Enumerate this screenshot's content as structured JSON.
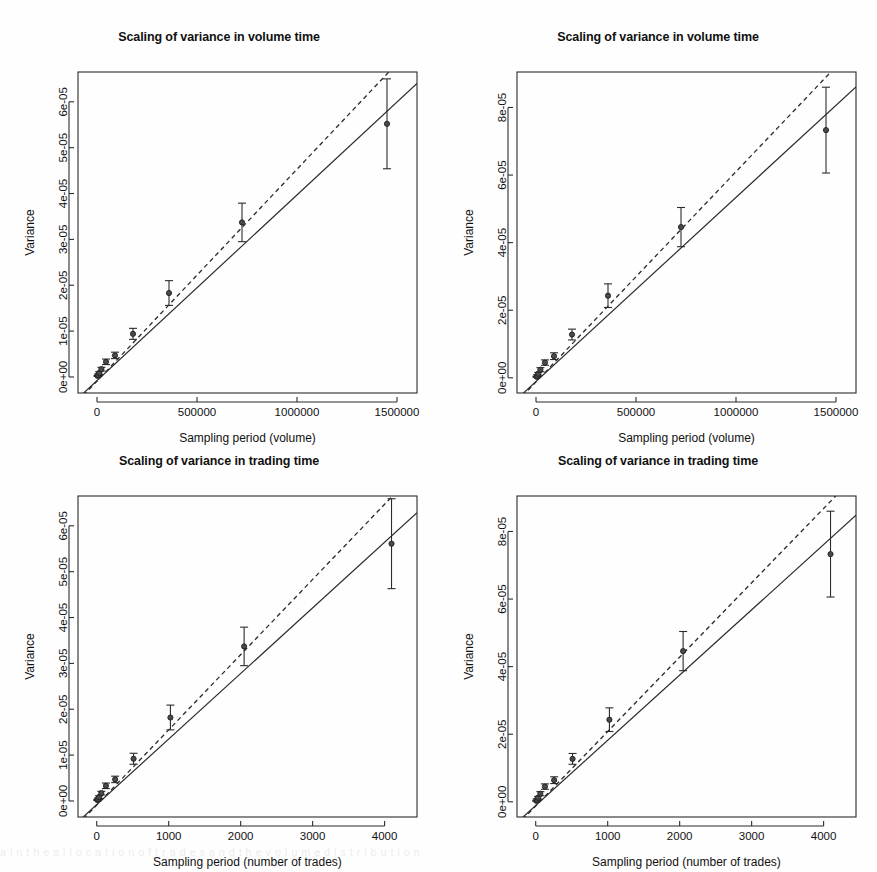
{
  "figure": {
    "width": 877,
    "height": 872,
    "background": "#ffffff",
    "ink_color": "#2b2b2b",
    "point_color": "#4a4a4a",
    "scan_artifact_text": "a i n t h e a l l o c a t i o n o f t r a d e s a n d t h e v o l u m e d i s t r i b u t i o n"
  },
  "chart_data": [
    {
      "id": "panel-tl",
      "type": "scatter",
      "title": "Scaling of variance in volume time",
      "xlabel": "Sampling period (volume)",
      "ylabel": "Variance",
      "xlim": [
        -95000,
        1600000
      ],
      "ylim": [
        -3.5e-06,
        6.65e-05
      ],
      "xticks": [
        0,
        500000,
        1000000,
        1500000
      ],
      "xticklabels": [
        "0",
        "500000",
        "1000000",
        "1500000"
      ],
      "yticks": [
        0,
        1e-05,
        2e-05,
        3e-05,
        4e-05,
        5e-05,
        6e-05
      ],
      "yticklabels": [
        "0e+00",
        "1e-05",
        "2e-05",
        "3e-05",
        "4e-05",
        "5e-05",
        "6e-05"
      ],
      "grid": false,
      "legend": "none",
      "x": [
        2800,
        5600,
        11000,
        22000,
        45000,
        90000,
        180000,
        360000,
        725000,
        1450000
      ],
      "y": [
        2.2e-07,
        4.4e-07,
        8.5e-07,
        1.7e-06,
        3.3e-06,
        4.7e-06,
        9.4e-06,
        1.83e-05,
        3.37e-05,
        5.52e-05
      ],
      "yerr_low": [
        1e-07,
        2e-07,
        3e-07,
        4e-07,
        6e-07,
        7e-07,
        1.2e-06,
        2.7e-06,
        4.2e-06,
        9.8e-06
      ],
      "yerr_high": [
        1e-07,
        2e-07,
        3e-07,
        4e-07,
        6e-07,
        7e-07,
        1.2e-06,
        2.7e-06,
        4.2e-06,
        9.8e-06
      ],
      "series": [
        {
          "name": "fitted line",
          "style": "solid",
          "intercept": -8e-07,
          "slope": 4.05e-11
        },
        {
          "name": "reference line",
          "style": "dashed",
          "intercept": -9e-07,
          "slope": 4.62e-11
        }
      ]
    },
    {
      "id": "panel-tr",
      "type": "scatter",
      "title": "Scaling of variance in volume time",
      "xlabel": "Sampling period (volume)",
      "ylabel": "Variance",
      "xlim": [
        -95000,
        1600000
      ],
      "ylim": [
        -4.5e-06,
        9.05e-05
      ],
      "xticks": [
        0,
        500000,
        1000000,
        1500000
      ],
      "xticklabels": [
        "0",
        "500000",
        "1000000",
        "1500000"
      ],
      "yticks": [
        0,
        2e-05,
        4e-05,
        6e-05,
        8e-05
      ],
      "yticklabels": [
        "0e+00",
        "2e-05",
        "4e-05",
        "6e-05",
        "8e-05"
      ],
      "grid": false,
      "legend": "none",
      "x": [
        2800,
        5600,
        11000,
        22000,
        45000,
        90000,
        180000,
        360000,
        725000,
        1450000
      ],
      "y": [
        3e-07,
        6e-07,
        1.2e-06,
        2.4e-06,
        4.5e-06,
        6.4e-06,
        1.28e-05,
        2.43e-05,
        4.46e-05,
        7.33e-05
      ],
      "yerr_low": [
        1.5e-07,
        3e-07,
        4e-07,
        6e-07,
        8e-07,
        1e-06,
        1.6e-06,
        3.5e-06,
        5.8e-06,
        1.27e-05
      ],
      "yerr_high": [
        1.5e-07,
        3e-07,
        4e-07,
        6e-07,
        8e-07,
        1e-06,
        1.6e-06,
        3.5e-06,
        5.8e-06,
        1.27e-05
      ],
      "series": [
        {
          "name": "fitted line",
          "style": "solid",
          "intercept": -1.1e-06,
          "slope": 5.45e-11
        },
        {
          "name": "reference line",
          "style": "dashed",
          "intercept": -1.2e-06,
          "slope": 6.22e-11
        }
      ]
    },
    {
      "id": "panel-bl",
      "type": "scatter",
      "title": "Scaling of variance in trading time",
      "xlabel": "Sampling period (number of trades)",
      "ylabel": "Variance",
      "xlim": [
        -260,
        4450
      ],
      "ylim": [
        -3.5e-06,
        6.65e-05
      ],
      "xticks": [
        0,
        1000,
        2000,
        3000,
        4000
      ],
      "xticklabels": [
        "0",
        "1000",
        "2000",
        "3000",
        "4000"
      ],
      "yticks": [
        0,
        1e-05,
        2e-05,
        3e-05,
        4e-05,
        5e-05,
        6e-05
      ],
      "yticklabels": [
        "0e+00",
        "1e-05",
        "2e-05",
        "3e-05",
        "4e-05",
        "5e-05",
        "6e-05"
      ],
      "grid": false,
      "legend": "none",
      "x": [
        8,
        16,
        32,
        64,
        128,
        256,
        512,
        1024,
        2048,
        4096
      ],
      "y": [
        2.1e-07,
        4.2e-07,
        8.3e-07,
        1.7e-06,
        3.3e-06,
        4.7e-06,
        9.2e-06,
        1.82e-05,
        3.37e-05,
        5.61e-05
      ],
      "yerr_low": [
        1e-07,
        2e-07,
        3e-07,
        4e-07,
        6e-07,
        7e-07,
        1.2e-06,
        2.7e-06,
        4.2e-06,
        9.8e-06
      ],
      "yerr_high": [
        1e-07,
        2e-07,
        3e-07,
        4e-07,
        6e-07,
        7e-07,
        1.2e-06,
        2.7e-06,
        4.2e-06,
        9.8e-06
      ],
      "series": [
        {
          "name": "fitted line",
          "style": "solid",
          "intercept": -8e-07,
          "slope": 1.43e-08
        },
        {
          "name": "reference line",
          "style": "dashed",
          "intercept": -9e-07,
          "slope": 1.64e-08
        }
      ]
    },
    {
      "id": "panel-br",
      "type": "scatter",
      "title": "Scaling of variance in trading time",
      "xlabel": "Sampling period (number of trades)",
      "ylabel": "Variance",
      "xlim": [
        -260,
        4450
      ],
      "ylim": [
        -4.5e-06,
        9.05e-05
      ],
      "xticks": [
        0,
        1000,
        2000,
        3000,
        4000
      ],
      "xticklabels": [
        "0",
        "1000",
        "2000",
        "3000",
        "4000"
      ],
      "yticks": [
        0,
        2e-05,
        4e-05,
        6e-05,
        8e-05
      ],
      "yticklabels": [
        "0e+00",
        "2e-05",
        "4e-05",
        "6e-05",
        "8e-05"
      ],
      "grid": false,
      "legend": "none",
      "x": [
        8,
        16,
        32,
        64,
        128,
        256,
        512,
        1024,
        2048,
        4096
      ],
      "y": [
        3e-07,
        6e-07,
        1.2e-06,
        2.4e-06,
        4.5e-06,
        6.4e-06,
        1.27e-05,
        2.43e-05,
        4.46e-05,
        7.33e-05
      ],
      "yerr_low": [
        1.5e-07,
        3e-07,
        4e-07,
        6e-07,
        8e-07,
        1e-06,
        1.6e-06,
        3.5e-06,
        5.8e-06,
        1.27e-05
      ],
      "yerr_high": [
        1.5e-07,
        3e-07,
        4e-07,
        6e-07,
        8e-07,
        1e-06,
        1.6e-06,
        3.5e-06,
        5.8e-06,
        1.27e-05
      ],
      "series": [
        {
          "name": "fitted line",
          "style": "solid",
          "intercept": -1.1e-06,
          "slope": 1.93e-08
        },
        {
          "name": "reference line",
          "style": "dashed",
          "intercept": -1.2e-06,
          "slope": 2.2e-08
        }
      ]
    }
  ]
}
